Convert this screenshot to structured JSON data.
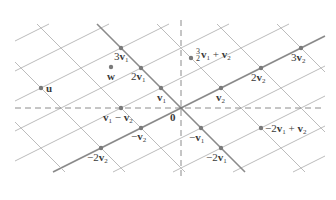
{
  "diagram": {
    "title": "",
    "origin_px": [
      181,
      108
    ],
    "v1_px": [
      -20,
      -20
    ],
    "v2_px": [
      40,
      -20
    ],
    "clip": {
      "x_min": 15,
      "x_max": 325,
      "y_min": 24,
      "y_max": 172
    },
    "colors": {
      "grid": "#b4b4b4",
      "thick": "#8a8a8a",
      "axis": "#8c8c8c",
      "point": "#7a7a7a",
      "text": "#3a3a3a"
    },
    "axes": {
      "horizontal": "dashed",
      "vertical": "dashed"
    },
    "points": [
      {
        "id": "origin",
        "label": "0",
        "s": 0,
        "t": 0,
        "dx": -12,
        "dy": 4
      },
      {
        "id": "v1",
        "label": "v1",
        "s": 1,
        "t": 0,
        "dx": -3,
        "dy": 4
      },
      {
        "id": "2v1",
        "label": "2v1",
        "s": 2,
        "t": 0,
        "dx": -24,
        "dy": 2
      },
      {
        "id": "3v1",
        "label": "3v1",
        "s": 3,
        "t": 0,
        "dx": -24,
        "dy": -9
      },
      {
        "id": "v2",
        "label": "v2",
        "s": 0,
        "t": 1,
        "dx": -6,
        "dy": 4
      },
      {
        "id": "2v2",
        "label": "2v2",
        "s": 0,
        "t": 2,
        "dx": -10,
        "dy": 4
      },
      {
        "id": "3v2",
        "label": "3v2",
        "s": 0,
        "t": 3,
        "dx": -10,
        "dy": 4
      },
      {
        "id": "v1-v2",
        "label": "v1 − v2",
        "s": 1,
        "t": -1,
        "dx": -19,
        "dy": 4
      },
      {
        "id": "-v2",
        "label": "−v2",
        "s": 0,
        "t": -1,
        "dx": -8,
        "dy": 4
      },
      {
        "id": "-2v2",
        "label": "−2v2",
        "s": 0,
        "t": -2,
        "dx": -13,
        "dy": 4
      },
      {
        "id": "-v1",
        "label": "−v1",
        "s": -1,
        "t": 0,
        "dx": -16,
        "dy": 4
      },
      {
        "id": "-2v1",
        "label": "−2v1",
        "s": -2,
        "t": 0,
        "dx": -15,
        "dy": 4
      },
      {
        "id": "-2v1+v2",
        "label": "−2v1 + v2",
        "s": -2,
        "t": 1,
        "dx": 4,
        "dy": -5
      },
      {
        "id": "1.5v1+v2",
        "label": "3/2 v1 + v2",
        "s": 1.5,
        "t": 1,
        "dx": 5,
        "dy": -10
      },
      {
        "id": "u",
        "label": "u",
        "px": [
          41,
          88
        ],
        "dx": 4,
        "dy": -4
      },
      {
        "id": "w",
        "label": "w",
        "px": [
          111,
          67
        ],
        "dx": -3,
        "dy": 4
      }
    ]
  }
}
